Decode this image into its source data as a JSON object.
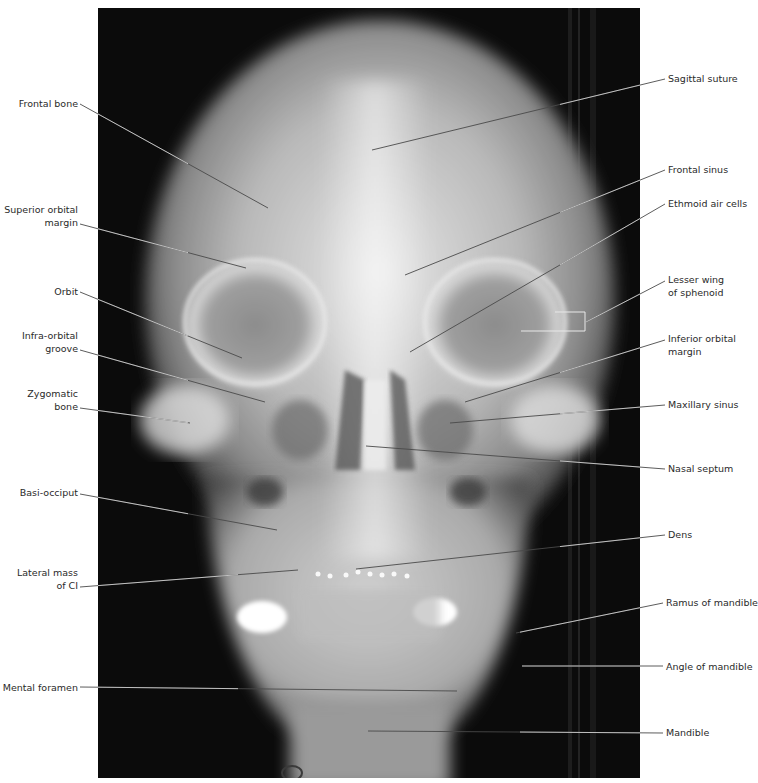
{
  "figure": {
    "colors": {
      "background": "#ffffff",
      "film": "#0a0a0a",
      "bone": "#d8d8d8",
      "leader_line": "#3a3a3a",
      "label_text": "#2a2a2a"
    },
    "radiograph_bounds": {
      "x": 98,
      "y": 8,
      "width": 542,
      "height": 770
    }
  },
  "labels_left": [
    {
      "id": "frontal-bone",
      "lines": [
        "Frontal bone"
      ],
      "x": 22,
      "y": 98,
      "anchor": [
        80,
        104
      ],
      "target": [
        268,
        208
      ]
    },
    {
      "id": "superior-orbital-margin",
      "lines": [
        "Superior orbital",
        "margin"
      ],
      "x": 8,
      "y": 204,
      "anchor": [
        80,
        224
      ],
      "target": [
        246,
        268
      ]
    },
    {
      "id": "orbit",
      "lines": [
        "Orbit"
      ],
      "x": 52,
      "y": 286,
      "anchor": [
        80,
        292
      ],
      "target": [
        242,
        358
      ]
    },
    {
      "id": "infra-orbital-groove",
      "lines": [
        "Infra-orbital",
        "groove"
      ],
      "x": 24,
      "y": 330,
      "anchor": [
        80,
        350
      ],
      "target": [
        265,
        402
      ]
    },
    {
      "id": "zygomatic-bone",
      "lines": [
        "Zygomatic",
        "bone"
      ],
      "x": 28,
      "y": 388,
      "anchor": [
        80,
        408
      ],
      "target": [
        190,
        423
      ]
    },
    {
      "id": "basi-occiput",
      "lines": [
        "Basi-occiput"
      ],
      "x": 20,
      "y": 487,
      "anchor": [
        80,
        494
      ],
      "target": [
        277,
        530
      ]
    },
    {
      "id": "lateral-mass-of-c1",
      "lines": [
        "Lateral mass",
        "of CI"
      ],
      "x": 20,
      "y": 567,
      "anchor": [
        80,
        587
      ],
      "target": [
        298,
        570
      ]
    },
    {
      "id": "mental-foramen",
      "lines": [
        "Mental foramen"
      ],
      "x": 3,
      "y": 682,
      "anchor": [
        80,
        687
      ],
      "target": [
        457,
        691
      ]
    }
  ],
  "labels_right": [
    {
      "id": "sagittal-suture",
      "lines": [
        "Sagittal suture"
      ],
      "x": 668,
      "y": 73,
      "anchor": [
        665,
        79
      ],
      "target": [
        372,
        150
      ]
    },
    {
      "id": "frontal-sinus",
      "lines": [
        "Frontal sinus"
      ],
      "x": 668,
      "y": 164,
      "anchor": [
        665,
        170
      ],
      "target": [
        405,
        275
      ]
    },
    {
      "id": "ethmoid-air-cells",
      "lines": [
        "Ethmoid air cells"
      ],
      "x": 668,
      "y": 198,
      "anchor": [
        665,
        204
      ],
      "target": [
        410,
        352
      ]
    },
    {
      "id": "lesser-wing-of-sphenoid",
      "lines": [
        "Lesser wing",
        "of sphenoid"
      ],
      "x": 668,
      "y": 274,
      "anchor": [
        665,
        281
      ],
      "target": [
        586,
        322
      ]
    },
    {
      "id": "inferior-orbital-margin",
      "lines": [
        "Inferior orbital",
        "margin"
      ],
      "x": 668,
      "y": 333,
      "anchor": [
        665,
        340
      ],
      "target": [
        465,
        402
      ]
    },
    {
      "id": "maxillary-sinus",
      "lines": [
        "Maxillary sinus"
      ],
      "x": 668,
      "y": 399,
      "anchor": [
        665,
        405
      ],
      "target": [
        450,
        423
      ]
    },
    {
      "id": "nasal-septum",
      "lines": [
        "Nasal septum"
      ],
      "x": 668,
      "y": 463,
      "anchor": [
        665,
        469
      ],
      "target": [
        366,
        446
      ]
    },
    {
      "id": "dens",
      "lines": [
        "Dens"
      ],
      "x": 668,
      "y": 529,
      "anchor": [
        665,
        535
      ],
      "target": [
        356,
        569
      ]
    },
    {
      "id": "ramus-of-mandible",
      "lines": [
        "Ramus of mandible"
      ],
      "x": 666,
      "y": 597,
      "anchor": [
        663,
        603
      ],
      "target": [
        516,
        633
      ]
    },
    {
      "id": "angle-of-mandible",
      "lines": [
        "Angle of mandible"
      ],
      "x": 666,
      "y": 661,
      "anchor": [
        663,
        666
      ],
      "target": [
        522,
        666
      ]
    },
    {
      "id": "mandible",
      "lines": [
        "Mandible"
      ],
      "x": 666,
      "y": 727,
      "anchor": [
        663,
        733
      ],
      "target": [
        368,
        731
      ]
    }
  ],
  "bracket": {
    "id": "lesser-wing-bracket",
    "top": [
      [
        555,
        312
      ],
      [
        585,
        312
      ]
    ],
    "vertical": [
      [
        585,
        312
      ],
      [
        585,
        331
      ]
    ],
    "bottom": [
      [
        521,
        331
      ],
      [
        585,
        331
      ]
    ]
  }
}
